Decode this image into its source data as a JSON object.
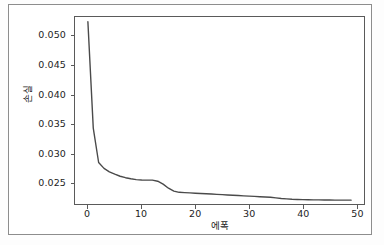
{
  "figure": {
    "background_color": "#ffffff",
    "frame_color": "#8d8d8d",
    "axis_color": "#5a5a5a",
    "line_color": "#4a4a4a",
    "tick_text_color": "#1d1d1d"
  },
  "chart_data": {
    "type": "line",
    "title": "",
    "xlabel": "에폭",
    "ylabel": "손실",
    "grid": false,
    "legend": null,
    "xlim": [
      -2.4,
      51.4
    ],
    "ylim": [
      0.0213,
      0.0533
    ],
    "xticks": [
      0,
      10,
      20,
      30,
      40,
      50
    ],
    "xtick_labels": [
      "0",
      "10",
      "20",
      "30",
      "40",
      "50"
    ],
    "yticks": [
      0.025,
      0.03,
      0.035,
      0.04,
      0.045,
      0.05
    ],
    "ytick_labels": [
      "0.025",
      "0.030",
      "0.035",
      "0.040",
      "0.045",
      "0.050"
    ],
    "series": [
      {
        "name": "손실",
        "color": "#4a4a4a",
        "x": [
          0,
          1,
          2,
          3,
          4,
          5,
          6,
          7,
          8,
          9,
          10,
          11,
          12,
          13,
          14,
          15,
          16,
          17,
          18,
          19,
          20,
          21,
          22,
          23,
          24,
          25,
          26,
          27,
          28,
          29,
          30,
          31,
          32,
          33,
          34,
          35,
          36,
          37,
          38,
          39,
          40,
          41,
          42,
          43,
          44,
          45,
          46,
          47,
          48,
          49
        ],
        "y": [
          0.0525,
          0.0343,
          0.0284,
          0.0274,
          0.0268,
          0.0264,
          0.02605,
          0.0258,
          0.02562,
          0.02548,
          0.0254,
          0.02538,
          0.02538,
          0.0252,
          0.0247,
          0.024,
          0.0235,
          0.0233,
          0.02325,
          0.0232,
          0.02315,
          0.0231,
          0.02305,
          0.023,
          0.02295,
          0.0229,
          0.02285,
          0.0228,
          0.02275,
          0.0227,
          0.02265,
          0.0226,
          0.02255,
          0.0225,
          0.02245,
          0.02235,
          0.02225,
          0.02218,
          0.02212,
          0.02208,
          0.02205,
          0.02203,
          0.02201,
          0.022,
          0.02199,
          0.02198,
          0.02197,
          0.02196,
          0.02196,
          0.02196
        ]
      }
    ]
  }
}
